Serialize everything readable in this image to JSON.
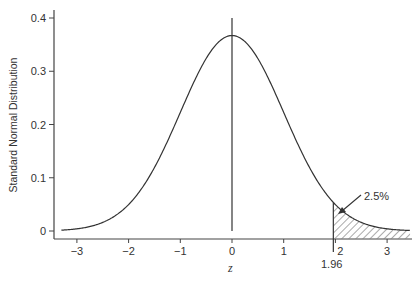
{
  "chart_data": {
    "type": "line",
    "title": "",
    "xlabel": "z",
    "ylabel": "Standard Normal Distribution",
    "xlim": [
      -3.4,
      3.5
    ],
    "ylim": [
      0,
      0.4
    ],
    "grid": false,
    "x_ticks": [
      -3,
      -2,
      -1,
      0,
      1,
      2,
      3
    ],
    "x_tick_labels": [
      "−3",
      "−2",
      "−1",
      "0",
      "1",
      "2",
      "3"
    ],
    "y_ticks": [
      0,
      0.1,
      0.2,
      0.3,
      0.4
    ],
    "y_tick_labels": [
      "0",
      "0.1",
      "0.2",
      "0.3",
      "0.4"
    ],
    "series": [
      {
        "name": "Standard normal density",
        "x": [
          -3.3,
          -3.0,
          -2.5,
          -2.0,
          -1.5,
          -1.0,
          -0.5,
          0.0,
          0.5,
          1.0,
          1.5,
          1.96,
          2.0,
          2.5,
          3.0,
          3.45
        ],
        "y": [
          0.002,
          0.004,
          0.018,
          0.054,
          0.13,
          0.242,
          0.352,
          0.399,
          0.352,
          0.242,
          0.13,
          0.058,
          0.054,
          0.018,
          0.004,
          0.001
        ]
      }
    ],
    "annotations": [
      {
        "type": "vertical-line",
        "x": 0,
        "label": ""
      },
      {
        "type": "shaded-region",
        "from": 1.96,
        "to": 3.45,
        "pattern": "hatch",
        "label": "2.5%"
      },
      {
        "type": "marker-label",
        "x": 1.96,
        "label": "1.96"
      }
    ]
  },
  "labels": {
    "ylabel": "Standard Normal Distribution",
    "xlabel": "z",
    "tail_percent": "2.5%",
    "critical_value": "1.96",
    "x_ticks": [
      "−3",
      "−2",
      "−1",
      "0",
      "1",
      "2",
      "3"
    ],
    "y_ticks": [
      "0",
      "0.1",
      "0.2",
      "0.3",
      "0.4"
    ]
  },
  "colors": {
    "line": "#333333",
    "axis": "#444444",
    "hatch": "#555555"
  }
}
